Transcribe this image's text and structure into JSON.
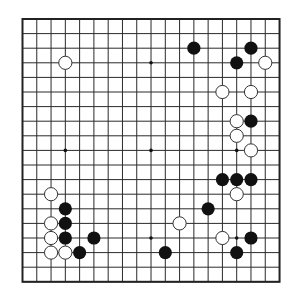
{
  "board": {
    "size": 19,
    "origin": {
      "x": 22.5,
      "y": 19
    },
    "spacing": {
      "x": 14.28,
      "y": 14.6
    },
    "stone_radius": 6.6,
    "colors": {
      "black": "#111111",
      "white": "#ffffff",
      "line": "#2a2a2a",
      "background": "#ffffff"
    },
    "star_points": [
      [
        3,
        3
      ],
      [
        9,
        3
      ],
      [
        15,
        3
      ],
      [
        3,
        9
      ],
      [
        9,
        9
      ],
      [
        15,
        9
      ],
      [
        3,
        15
      ],
      [
        9,
        15
      ],
      [
        15,
        15
      ]
    ],
    "black_stones": [
      [
        12,
        2
      ],
      [
        16,
        2
      ],
      [
        15,
        3
      ],
      [
        16,
        7
      ],
      [
        14,
        11
      ],
      [
        15,
        11
      ],
      [
        16,
        11
      ],
      [
        13,
        13
      ],
      [
        3,
        13
      ],
      [
        3,
        14
      ],
      [
        3,
        15
      ],
      [
        5,
        15
      ],
      [
        4,
        16
      ],
      [
        10,
        16
      ],
      [
        16,
        15
      ],
      [
        15,
        16
      ]
    ],
    "white_stones": [
      [
        3,
        3
      ],
      [
        17,
        3
      ],
      [
        14,
        5
      ],
      [
        16,
        5
      ],
      [
        15,
        7
      ],
      [
        15,
        8
      ],
      [
        16,
        9
      ],
      [
        15,
        12
      ],
      [
        2,
        12
      ],
      [
        2,
        14
      ],
      [
        2,
        15
      ],
      [
        2,
        16
      ],
      [
        3,
        16
      ],
      [
        11,
        14
      ],
      [
        14,
        15
      ]
    ]
  }
}
